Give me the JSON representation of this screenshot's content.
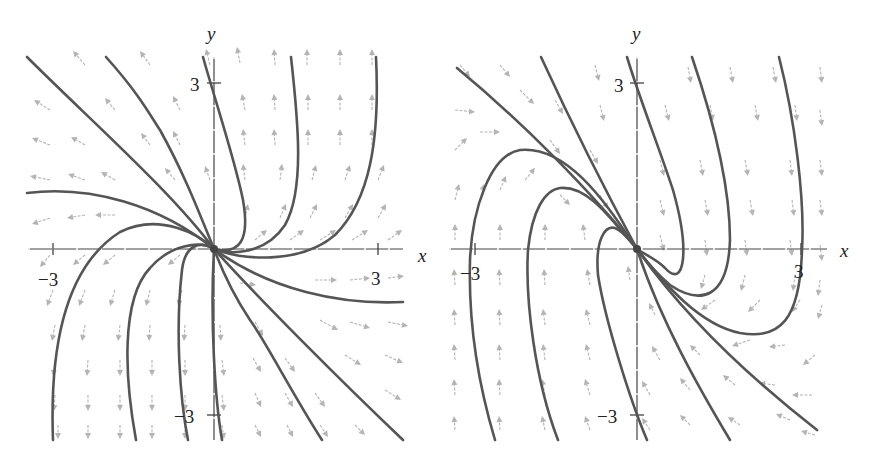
{
  "chart_data": [
    {
      "type": "phase_portrait",
      "title": "",
      "xlabel": "x",
      "ylabel": "y",
      "xlim": [
        -3.5,
        3.5
      ],
      "ylim": [
        -3.5,
        3.5
      ],
      "tick_labels": {
        "x": [
          "-3",
          "3"
        ],
        "y": [
          "3",
          "-3"
        ]
      },
      "equilibrium": {
        "x": 0,
        "y": 0,
        "kind": "source"
      },
      "field_direction": "outward from origin; arrows point up in upper half, down in lower half",
      "colors": {
        "trajectory": "#555555",
        "vector": "#b4b4b4",
        "axis": "#444444"
      }
    },
    {
      "type": "phase_portrait",
      "title": "",
      "xlabel": "x",
      "ylabel": "y",
      "xlim": [
        -3.5,
        3.5
      ],
      "ylim": [
        -3.5,
        3.5
      ],
      "tick_labels": {
        "x": [
          "-3",
          "3"
        ],
        "y": [
          "3",
          "-3"
        ]
      },
      "equilibrium": {
        "x": 0,
        "y": 0,
        "kind": "saddle-like"
      },
      "field_direction": "arrows point down on right side, up on left side",
      "colors": {
        "trajectory": "#555555",
        "vector": "#b4b4b4",
        "axis": "#444444"
      }
    }
  ],
  "panels": [
    {
      "id": "left",
      "origin": [
        214,
        249
      ],
      "x_axis": [
        28,
        403
      ],
      "y_axis": [
        57,
        440
      ],
      "ticks": {
        "x_neg": 53,
        "x_pos": 378,
        "y_pos": 83,
        "y_neg": 415
      },
      "labels": {
        "x": {
          "text": "x",
          "pos": [
            418,
            262
          ]
        },
        "y": {
          "text": "y",
          "pos": [
            207,
            40
          ]
        },
        "x_neg": {
          "text": "−3",
          "pos": [
            38,
            286
          ]
        },
        "x_pos": {
          "text": "3",
          "pos": [
            371,
            285
          ]
        },
        "y_pos": {
          "text": "3",
          "pos": [
            190,
            91
          ]
        },
        "y_neg": {
          "text": "−3",
          "pos": [
            174,
            423
          ]
        }
      },
      "trajectories": [
        "M27,57 C90,120 170,190 214,249",
        "M106,57 C140,95 150,115 160,130 C185,175 200,215 214,249",
        "M203,57 C215,100 235,160 243,200 C250,240 240,255 214,249",
        "M291,57 C298,120 305,190 285,225 C265,255 230,255 214,249",
        "M376,57 C380,140 370,200 335,235 C300,265 240,260 214,249",
        "M27,193 C90,185 160,205 214,249",
        "M53,440 C50,360 60,270 120,232 C160,212 200,235 214,249",
        "M136,440 C125,380 120,300 150,268 C170,245 200,240 214,249",
        "M188,440 C180,400 175,330 182,270 C185,245 200,240 214,249",
        "M222,440 C215,400 210,320 214,249",
        "M322,440 C290,390 265,340 250,320 C230,290 220,265 214,249",
        "M403,440 C340,380 260,300 214,249",
        "M403,302 C340,305 270,290 214,249"
      ],
      "vectors": [
        [
          85,
          65,
          -12,
          -14
        ],
        [
          150,
          65,
          -10,
          -14
        ],
        [
          210,
          65,
          -4,
          -16
        ],
        [
          240,
          63,
          -3,
          -16
        ],
        [
          275,
          65,
          -1,
          -16
        ],
        [
          307,
          65,
          0,
          -16
        ],
        [
          340,
          65,
          0,
          -16
        ],
        [
          372,
          65,
          0,
          -16
        ],
        [
          50,
          110,
          -16,
          -10
        ],
        [
          115,
          110,
          -10,
          -12
        ],
        [
          180,
          110,
          -7,
          -14
        ],
        [
          245,
          110,
          -3,
          -16
        ],
        [
          275,
          110,
          -1,
          -16
        ],
        [
          308,
          110,
          0,
          -16
        ],
        [
          340,
          110,
          0,
          -16
        ],
        [
          372,
          110,
          0,
          -16
        ],
        [
          50,
          145,
          -18,
          -7
        ],
        [
          85,
          145,
          -14,
          -8
        ],
        [
          150,
          145,
          -9,
          -12
        ],
        [
          180,
          145,
          -7,
          -14
        ],
        [
          245,
          145,
          -2,
          -16
        ],
        [
          275,
          145,
          -1,
          -16
        ],
        [
          308,
          145,
          0,
          -16
        ],
        [
          340,
          145,
          0,
          -16
        ],
        [
          372,
          145,
          0,
          -16
        ],
        [
          50,
          180,
          -20,
          -4
        ],
        [
          85,
          180,
          -17,
          -6
        ],
        [
          115,
          180,
          -14,
          -8
        ],
        [
          175,
          180,
          -10,
          -12
        ],
        [
          210,
          180,
          -5,
          -14
        ],
        [
          245,
          180,
          -2,
          -16
        ],
        [
          280,
          180,
          2,
          -16
        ],
        [
          312,
          180,
          4,
          -15
        ],
        [
          345,
          180,
          5,
          -15
        ],
        [
          378,
          180,
          6,
          -15
        ],
        [
          50,
          218,
          -18,
          6
        ],
        [
          85,
          215,
          -18,
          3
        ],
        [
          115,
          215,
          -20,
          0
        ],
        [
          245,
          218,
          3,
          -14
        ],
        [
          280,
          218,
          6,
          -14
        ],
        [
          310,
          218,
          7,
          -14
        ],
        [
          345,
          218,
          8,
          -14
        ],
        [
          378,
          218,
          8,
          -14
        ],
        [
          50,
          255,
          -10,
          12
        ],
        [
          85,
          255,
          -12,
          10
        ],
        [
          115,
          255,
          -12,
          10
        ],
        [
          180,
          255,
          -12,
          10
        ],
        [
          255,
          240,
          12,
          -10
        ],
        [
          290,
          240,
          14,
          -10
        ],
        [
          320,
          240,
          16,
          -10
        ],
        [
          352,
          240,
          16,
          -10
        ],
        [
          388,
          240,
          14,
          -10
        ],
        [
          53,
          290,
          -6,
          16
        ],
        [
          85,
          290,
          -6,
          16
        ],
        [
          115,
          290,
          -5,
          16
        ],
        [
          150,
          290,
          -4,
          16
        ],
        [
          182,
          290,
          -4,
          16
        ],
        [
          240,
          283,
          16,
          2
        ],
        [
          315,
          280,
          22,
          0
        ],
        [
          350,
          280,
          20,
          -2
        ],
        [
          388,
          278,
          16,
          -2
        ],
        [
          55,
          325,
          -3,
          16
        ],
        [
          85,
          325,
          -3,
          16
        ],
        [
          120,
          325,
          -2,
          16
        ],
        [
          150,
          325,
          -1,
          16
        ],
        [
          185,
          325,
          -1,
          16
        ],
        [
          220,
          325,
          1,
          16
        ],
        [
          255,
          322,
          8,
          14
        ],
        [
          320,
          320,
          18,
          10
        ],
        [
          350,
          322,
          20,
          6
        ],
        [
          388,
          322,
          20,
          4
        ],
        [
          55,
          360,
          -2,
          16
        ],
        [
          88,
          360,
          -1,
          16
        ],
        [
          120,
          360,
          0,
          16
        ],
        [
          152,
          360,
          0,
          16
        ],
        [
          185,
          360,
          0,
          16
        ],
        [
          222,
          360,
          2,
          16
        ],
        [
          253,
          358,
          8,
          14
        ],
        [
          285,
          358,
          10,
          14
        ],
        [
          345,
          355,
          16,
          10
        ],
        [
          385,
          355,
          18,
          8
        ],
        [
          55,
          395,
          -1,
          16
        ],
        [
          88,
          395,
          0,
          16
        ],
        [
          120,
          395,
          0,
          16
        ],
        [
          152,
          395,
          0,
          16
        ],
        [
          185,
          395,
          0,
          16
        ],
        [
          222,
          395,
          2,
          16
        ],
        [
          255,
          393,
          6,
          14
        ],
        [
          285,
          393,
          8,
          14
        ],
        [
          315,
          393,
          10,
          14
        ],
        [
          385,
          390,
          16,
          10
        ],
        [
          58,
          425,
          0,
          14
        ],
        [
          88,
          425,
          0,
          14
        ],
        [
          120,
          425,
          0,
          14
        ],
        [
          152,
          425,
          0,
          14
        ],
        [
          185,
          425,
          0,
          14
        ],
        [
          222,
          425,
          2,
          14
        ],
        [
          255,
          425,
          6,
          12
        ],
        [
          287,
          425,
          6,
          12
        ],
        [
          320,
          425,
          8,
          12
        ],
        [
          355,
          425,
          10,
          10
        ]
      ]
    },
    {
      "id": "right",
      "origin": [
        637,
        249
      ],
      "x_axis": [
        449,
        827
      ],
      "y_axis": [
        57,
        440
      ],
      "ticks": {
        "x_neg": 475,
        "x_pos": 801,
        "y_pos": 83,
        "y_neg": 415
      },
      "labels": {
        "x": {
          "text": "x",
          "pos": [
            840,
            257
          ]
        },
        "y": {
          "text": "y",
          "pos": [
            632,
            40
          ]
        },
        "x_neg": {
          "text": "−3",
          "pos": [
            460,
            280
          ]
        },
        "x_pos": {
          "text": "3",
          "pos": [
            794,
            278
          ]
        },
        "y_pos": {
          "text": "3",
          "pos": [
            614,
            92
          ]
        },
        "y_neg": {
          "text": "−3",
          "pos": [
            597,
            423
          ]
        }
      },
      "trajectories": [
        "M457,68 C520,120 590,190 637,249",
        "M541,57 C570,120 605,190 637,249",
        "M627,57 C640,100 660,150 673,190 C690,250 685,290 665,268 C655,258 645,255 637,249",
        "M692,57 C710,110 730,180 730,240 C728,300 700,305 670,285 C655,272 645,260 637,249",
        "M779,57 C795,120 805,200 802,250 C800,320 780,340 740,333 C700,325 665,285 637,249",
        "M495,440 C480,390 468,330 470,260 C472,210 490,155 520,150 C570,145 610,210 637,249",
        "M558,440 C535,380 525,300 528,250 C532,210 545,190 560,188 C590,185 615,225 637,249",
        "M647,440 C630,400 605,320 598,275 C595,240 605,225 615,228 C625,232 632,244 637,249",
        "M730,440 C700,390 660,320 637,249",
        "M817,430 C740,370 680,310 637,249"
      ],
      "vectors": [
        [
          460,
          65,
          10,
          12
        ],
        [
          500,
          65,
          10,
          12
        ],
        [
          595,
          65,
          4,
          16
        ],
        [
          688,
          67,
          3,
          16
        ],
        [
          730,
          67,
          3,
          16
        ],
        [
          773,
          67,
          3,
          16
        ],
        [
          820,
          67,
          2,
          16
        ],
        [
          455,
          110,
          20,
          2
        ],
        [
          520,
          90,
          14,
          14
        ],
        [
          555,
          100,
          8,
          14
        ],
        [
          600,
          105,
          4,
          16
        ],
        [
          665,
          105,
          4,
          16
        ],
        [
          710,
          105,
          3,
          16
        ],
        [
          755,
          105,
          3,
          16
        ],
        [
          795,
          105,
          2,
          16
        ],
        [
          820,
          110,
          2,
          16
        ],
        [
          455,
          150,
          12,
          -12
        ],
        [
          480,
          132,
          20,
          0
        ],
        [
          550,
          140,
          10,
          14
        ],
        [
          590,
          150,
          8,
          14
        ],
        [
          660,
          160,
          4,
          16
        ],
        [
          700,
          160,
          3,
          16
        ],
        [
          745,
          160,
          3,
          16
        ],
        [
          790,
          160,
          2,
          16
        ],
        [
          820,
          160,
          2,
          16
        ],
        [
          455,
          200,
          4,
          -16
        ],
        [
          480,
          200,
          4,
          -16
        ],
        [
          500,
          190,
          6,
          -14
        ],
        [
          525,
          180,
          10,
          -12
        ],
        [
          560,
          195,
          10,
          10
        ],
        [
          600,
          195,
          8,
          14
        ],
        [
          660,
          200,
          4,
          16
        ],
        [
          705,
          200,
          3,
          16
        ],
        [
          750,
          200,
          3,
          16
        ],
        [
          792,
          200,
          2,
          16
        ],
        [
          820,
          200,
          2,
          16
        ],
        [
          455,
          240,
          0,
          -16
        ],
        [
          500,
          240,
          0,
          -16
        ],
        [
          545,
          240,
          0,
          -16
        ],
        [
          585,
          240,
          -2,
          -16
        ],
        [
          660,
          235,
          4,
          16
        ],
        [
          705,
          240,
          2,
          16
        ],
        [
          745,
          240,
          2,
          16
        ],
        [
          790,
          240,
          2,
          16
        ],
        [
          820,
          245,
          2,
          16
        ],
        [
          455,
          285,
          -1,
          -16
        ],
        [
          500,
          285,
          -1,
          -16
        ],
        [
          545,
          285,
          -1,
          -16
        ],
        [
          590,
          285,
          -3,
          -16
        ],
        [
          630,
          280,
          -2,
          -14
        ],
        [
          705,
          275,
          -4,
          14
        ],
        [
          745,
          275,
          -4,
          16
        ],
        [
          795,
          275,
          -2,
          16
        ],
        [
          820,
          280,
          -2,
          16
        ],
        [
          455,
          325,
          -1,
          -16
        ],
        [
          500,
          325,
          -1,
          -16
        ],
        [
          545,
          325,
          -2,
          -16
        ],
        [
          590,
          325,
          -4,
          -16
        ],
        [
          655,
          315,
          -6,
          -12
        ],
        [
          715,
          300,
          -14,
          10
        ],
        [
          760,
          300,
          -12,
          12
        ],
        [
          800,
          300,
          -8,
          12
        ],
        [
          822,
          305,
          -4,
          14
        ],
        [
          455,
          360,
          -1,
          -16
        ],
        [
          500,
          360,
          -1,
          -16
        ],
        [
          545,
          360,
          -2,
          -16
        ],
        [
          590,
          360,
          -4,
          -16
        ],
        [
          660,
          360,
          -8,
          -14
        ],
        [
          700,
          355,
          -10,
          -10
        ],
        [
          750,
          340,
          -18,
          6
        ],
        [
          785,
          345,
          -16,
          2
        ],
        [
          815,
          355,
          -12,
          10
        ],
        [
          455,
          395,
          -1,
          -16
        ],
        [
          500,
          395,
          -1,
          -16
        ],
        [
          545,
          395,
          -3,
          -16
        ],
        [
          590,
          395,
          -5,
          -16
        ],
        [
          650,
          395,
          -8,
          -14
        ],
        [
          690,
          390,
          -10,
          -12
        ],
        [
          735,
          385,
          -12,
          -10
        ],
        [
          775,
          385,
          -16,
          -2
        ],
        [
          812,
          395,
          -20,
          0
        ],
        [
          455,
          430,
          -1,
          -14
        ],
        [
          500,
          430,
          -1,
          -14
        ],
        [
          545,
          430,
          -3,
          -14
        ],
        [
          590,
          430,
          -5,
          -14
        ],
        [
          650,
          430,
          -8,
          -12
        ],
        [
          690,
          425,
          -10,
          -10
        ],
        [
          740,
          425,
          -12,
          -8
        ],
        [
          790,
          420,
          -14,
          -6
        ],
        [
          815,
          435,
          -14,
          -4
        ]
      ]
    }
  ]
}
